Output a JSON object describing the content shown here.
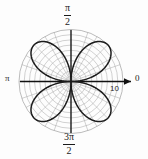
{
  "figure": {
    "title": "",
    "background_color": "#fdfdfd",
    "width": 148,
    "height": 159
  },
  "labels": {
    "angle_top_numerator": "π",
    "angle_top_denominator": "2",
    "angle_bottom_numerator": "3π",
    "angle_bottom_denominator": "2",
    "angle_left": "π",
    "angle_right": "0",
    "radial_tick": "10"
  },
  "colors": {
    "grid": "#9a9a9a",
    "axis": "#111111",
    "curve": "#1a1a1a",
    "text": "#1a1a1a"
  },
  "chart_data": {
    "type": "line",
    "plot_kind": "polar",
    "title": "",
    "xlabel": "",
    "ylabel": "",
    "equation": "r = 10 sin(2θ)",
    "curve_name": "four-petaled rose",
    "petal_count": 4,
    "petal_max_radius": 10,
    "petal_angles_deg": [
      45,
      135,
      225,
      315
    ],
    "theta_label_positions": {
      "right": "0",
      "top": "π/2",
      "left": "π",
      "bottom": "3π/2"
    },
    "radial_ticks": [
      1,
      2,
      3,
      4,
      5,
      6,
      7,
      8,
      9,
      10
    ],
    "radial_tick_labels": [
      "",
      "",
      "",
      "",
      "",
      "",
      "",
      "",
      "",
      "10"
    ],
    "rlim": [
      0,
      10
    ],
    "angular_gridline_step_deg": 15,
    "grid": true,
    "legend": "none",
    "theta_samples_deg": [
      0,
      5,
      10,
      15,
      20,
      25,
      30,
      35,
      40,
      45,
      50,
      55,
      60,
      65,
      70,
      75,
      80,
      85,
      90
    ],
    "r_samples": [
      0.0,
      1.74,
      3.42,
      5.0,
      6.43,
      7.66,
      8.66,
      9.4,
      9.85,
      10.0,
      9.85,
      9.4,
      8.66,
      7.66,
      6.43,
      5.0,
      3.42,
      1.74,
      0.0
    ]
  }
}
